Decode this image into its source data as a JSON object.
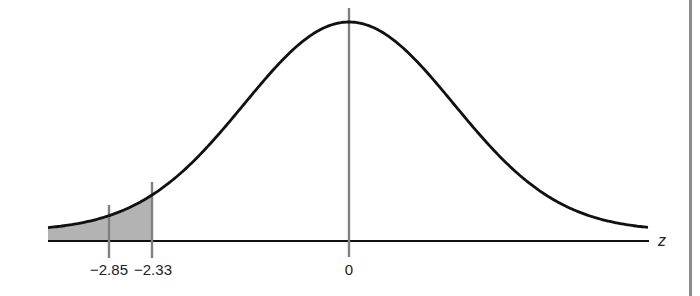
{
  "chart_data": {
    "type": "area",
    "title": "",
    "xlabel": "z",
    "ylabel": "",
    "x_ticks": [
      {
        "value": -2.85,
        "label": "−2.85"
      },
      {
        "value": -2.33,
        "label": "−2.33"
      },
      {
        "value": 0,
        "label": "0"
      }
    ],
    "curve": {
      "distribution": "standard normal",
      "mean": 0,
      "sd": 1
    },
    "shaded_region": {
      "from": "-inf",
      "to": -2.33,
      "color": "#b3b3b3"
    },
    "reference_lines": [
      -2.85,
      -2.33,
      0
    ],
    "grid": false,
    "legend": null
  },
  "colors": {
    "curve": "#111111",
    "axis": "#111111",
    "reference_line": "#808080",
    "shade": "#b3b3b3",
    "right_rule": "#8c8c8c"
  },
  "labels": {
    "tick_m285": "−2.85",
    "tick_m233": "−2.33",
    "tick_0": "0",
    "axis_var": "z"
  }
}
